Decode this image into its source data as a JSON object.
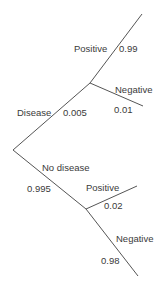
{
  "diagram": {
    "type": "probability-tree",
    "stroke_color": "#555555",
    "root": {
      "branches": [
        {
          "label": "Disease",
          "probability": "0.005",
          "children": [
            {
              "label": "Positive",
              "probability": "0.99"
            },
            {
              "label": "Negative",
              "probability": "0.01"
            }
          ]
        },
        {
          "label": "No disease",
          "probability": "0.995",
          "children": [
            {
              "label": "Positive",
              "probability": "0.02"
            },
            {
              "label": "Negative",
              "probability": "0.98"
            }
          ]
        }
      ]
    }
  }
}
